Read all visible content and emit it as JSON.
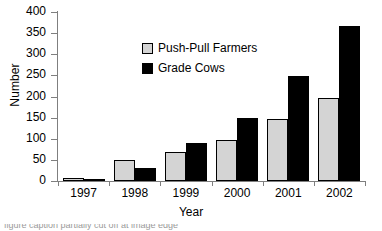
{
  "chart_data": {
    "type": "bar",
    "title": "",
    "xlabel": "Year",
    "ylabel": "Number",
    "categories": [
      "1997",
      "1998",
      "1999",
      "2000",
      "2001",
      "2002"
    ],
    "series": [
      {
        "name": "Push-Pull Farmers",
        "color": "#d4d4d4",
        "values": [
          7,
          50,
          68,
          98,
          147,
          197
        ]
      },
      {
        "name": "Grade Cows",
        "color": "#000000",
        "values": [
          4,
          30,
          89,
          148,
          248,
          367
        ]
      }
    ],
    "ylim": [
      0,
      400
    ],
    "yticks": [
      0,
      50,
      100,
      150,
      200,
      250,
      300,
      350,
      400
    ],
    "ytick_labels": [
      "0",
      "50",
      "100",
      "150",
      "200",
      "250",
      "300",
      "350",
      "400"
    ],
    "grid": false,
    "legend_position": "upper center",
    "axis_color": "#7f7f7f",
    "bar_border_color": "#000000"
  },
  "caption": {
    "text": "figure caption partially cut off at image edge"
  }
}
